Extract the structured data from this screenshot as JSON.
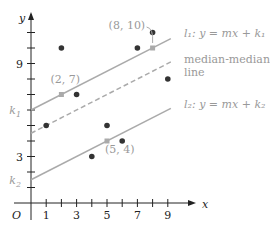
{
  "chart_data": {
    "type": "scatter",
    "title": "",
    "xlabel": "x",
    "ylabel": "y",
    "origin_label": "O",
    "xlim": [
      0,
      10
    ],
    "ylim": [
      0,
      12
    ],
    "x_ticks": [
      1,
      2,
      3,
      4,
      5,
      6,
      7,
      8,
      9
    ],
    "x_tick_labels": [
      {
        "value": 1,
        "label": "1"
      },
      {
        "value": 3,
        "label": "3"
      },
      {
        "value": 5,
        "label": "5"
      },
      {
        "value": 7,
        "label": "7"
      },
      {
        "value": 9,
        "label": "9"
      }
    ],
    "y_ticks": [
      1,
      2,
      3,
      4,
      5,
      6,
      7,
      8,
      9,
      10,
      11
    ],
    "y_tick_labels": [
      {
        "value": 3,
        "label": "3"
      },
      {
        "value": 9,
        "label": "9"
      }
    ],
    "y_intercept_labels": [
      {
        "value": 6,
        "label": "k",
        "sub": "1"
      },
      {
        "value": 1.5,
        "label": "k",
        "sub": "2"
      }
    ],
    "points": [
      {
        "x": 1,
        "y": 5
      },
      {
        "x": 2,
        "y": 10
      },
      {
        "x": 3,
        "y": 7
      },
      {
        "x": 4,
        "y": 3
      },
      {
        "x": 5,
        "y": 5
      },
      {
        "x": 6,
        "y": 4
      },
      {
        "x": 7,
        "y": 10
      },
      {
        "x": 8,
        "y": 11
      },
      {
        "x": 9,
        "y": 8
      }
    ],
    "summary_points": [
      {
        "x": 2,
        "y": 7,
        "label": "(2, 7)"
      },
      {
        "x": 5,
        "y": 4,
        "label": "(5, 4)"
      },
      {
        "x": 8,
        "y": 10,
        "label": "(8, 10)"
      }
    ],
    "lines": [
      {
        "name": "l1",
        "slope": 0.5,
        "intercept": 6,
        "style": "solid",
        "label": "l₁: y = mx + k₁"
      },
      {
        "name": "median-median",
        "slope": 0.5,
        "intercept": 4.5,
        "style": "dashed",
        "label_line1": "median-median",
        "label_line2": "line"
      },
      {
        "name": "l2",
        "slope": 0.5,
        "intercept": 1.5,
        "style": "solid",
        "label": "l₂: y = mx + k₂"
      }
    ],
    "grid": false,
    "colors": {
      "points": "#333333",
      "lines": "#aaaaaa",
      "summary_points": "#aaaaaa",
      "axes": "#222222"
    }
  }
}
